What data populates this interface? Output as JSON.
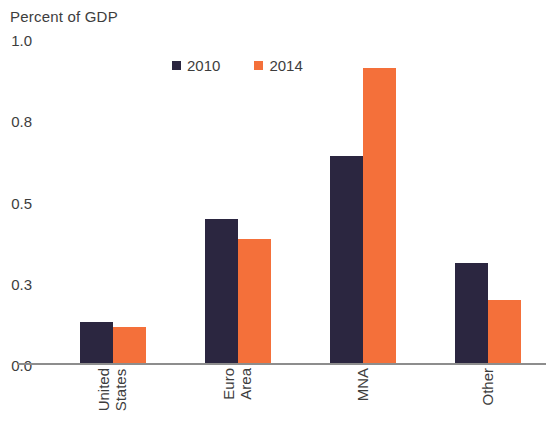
{
  "chart_data": {
    "type": "bar",
    "title": "Percent of GDP",
    "xlabel": "",
    "ylabel": "",
    "categories": [
      "United States",
      "Euro Area",
      "MNA",
      "Other"
    ],
    "category_lines": [
      [
        "United",
        "States"
      ],
      [
        "Euro",
        "Area"
      ],
      [
        "MNA"
      ],
      [
        "Other"
      ]
    ],
    "series": [
      {
        "name": "2010",
        "color": "#2b2640",
        "values": [
          0.16,
          0.46,
          0.67,
          0.35
        ]
      },
      {
        "name": "2014",
        "color": "#f4703a",
        "values": [
          0.14,
          0.41,
          0.93,
          0.24
        ]
      }
    ],
    "ytick_labels": [
      "1.0",
      "0.8",
      "0.5",
      "0.3",
      "0.0"
    ],
    "ytick_values": [
      1.0,
      0.8,
      0.5,
      0.3,
      0.0
    ],
    "ylim": [
      0.0,
      1.0
    ],
    "grid": false,
    "legend_position": "top-center",
    "axis_color": "#8d8d8d"
  },
  "legend": {
    "entries": [
      {
        "label": "2010"
      },
      {
        "label": "2014"
      }
    ]
  }
}
